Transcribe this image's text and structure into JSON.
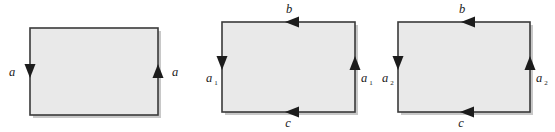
{
  "figure_set": {
    "title": "Rectangle edge identification diagrams",
    "background_color": "#ffffff",
    "face_fill_color": "#e9e9e9",
    "edge_stroke_color": "#3a3a3a",
    "label_color": "#1a1a1a",
    "figures": [
      {
        "id": "figure-1",
        "rect": {
          "x": 30,
          "y": 28,
          "width": 128,
          "height": 87
        },
        "labels": {
          "left": "a",
          "left_sub": "",
          "right": "a",
          "right_sub": "",
          "top": "",
          "bottom": ""
        },
        "arrows": [
          {
            "edge": "left",
            "direction": "down"
          },
          {
            "edge": "right",
            "direction": "up"
          }
        ]
      },
      {
        "id": "figure-2",
        "rect": {
          "x": 222,
          "y": 22,
          "width": 133,
          "height": 90
        },
        "labels": {
          "left": "a",
          "left_sub": "1",
          "right": "a",
          "right_sub": "1",
          "top": "b",
          "bottom": "c"
        },
        "arrows": [
          {
            "edge": "left",
            "direction": "down"
          },
          {
            "edge": "right",
            "direction": "up"
          },
          {
            "edge": "top",
            "direction": "left"
          },
          {
            "edge": "bottom",
            "direction": "left"
          }
        ]
      },
      {
        "id": "figure-3",
        "rect": {
          "x": 398,
          "y": 22,
          "width": 132,
          "height": 90
        },
        "labels": {
          "left": "a",
          "left_sub": "2",
          "right": "a",
          "right_sub": "2",
          "top": "b",
          "bottom": "c"
        },
        "arrows": [
          {
            "edge": "left",
            "direction": "down"
          },
          {
            "edge": "right",
            "direction": "up"
          },
          {
            "edge": "top",
            "direction": "left"
          },
          {
            "edge": "bottom",
            "direction": "left"
          }
        ]
      }
    ]
  }
}
